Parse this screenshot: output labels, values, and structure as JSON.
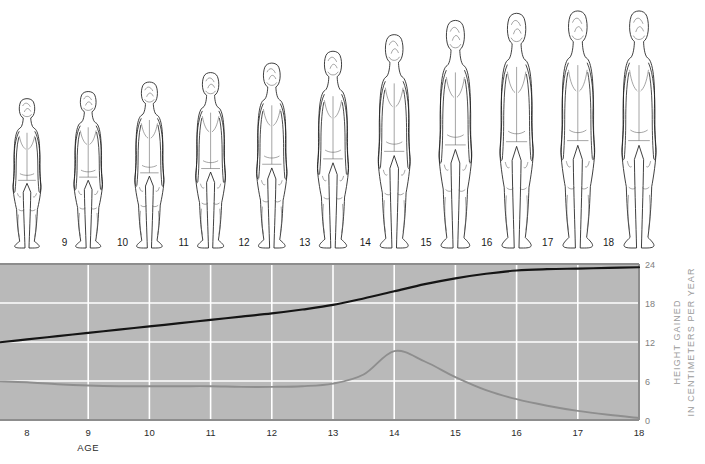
{
  "figures": {
    "caption_note": "Back-view line drawings of a growing human figure, one per age",
    "ages": [
      "8",
      "9",
      "10",
      "11",
      "12",
      "13",
      "14",
      "15",
      "16",
      "17",
      "18"
    ],
    "relative_heights": [
      0.63,
      0.66,
      0.7,
      0.74,
      0.78,
      0.83,
      0.9,
      0.96,
      0.99,
      1.0,
      1.0
    ],
    "line_color": "#1d1d1d",
    "fill_color": "#ffffff"
  },
  "chart_data": {
    "type": "line",
    "title": "",
    "subtitle": "",
    "xlabel": "AGE",
    "ylabel": "HEIGHT GAINED IN CENTIMETERS PER YEAR",
    "ylabel_line1": "HEIGHT GAINED",
    "ylabel_line2": "IN CENTIMETERS PER YEAR",
    "xlim": [
      8,
      18
    ],
    "ylim": [
      0,
      24
    ],
    "xticks": [
      "8",
      "9",
      "10",
      "11",
      "12",
      "13",
      "14",
      "15",
      "16",
      "17",
      "18"
    ],
    "yticks": [
      "0",
      "6",
      "12",
      "18",
      "24"
    ],
    "grid": true,
    "legend_position": "none",
    "plot_background": "#b9b9b9",
    "gridline_color": "#ffffff",
    "x": [
      8,
      8.5,
      9,
      9.5,
      10,
      10.5,
      11,
      11.5,
      12,
      12.5,
      13,
      13.5,
      14,
      14.5,
      15,
      15.5,
      16,
      16.5,
      17,
      17.5,
      18
    ],
    "series": [
      {
        "name": "Cumulative height gained",
        "color": "#151515",
        "values": [
          12.4,
          12.9,
          13.4,
          13.9,
          14.4,
          14.9,
          15.4,
          15.9,
          16.4,
          17.0,
          17.7,
          18.7,
          19.8,
          20.9,
          21.8,
          22.5,
          23.0,
          23.2,
          23.3,
          23.4,
          23.5
        ]
      },
      {
        "name": "Height gained per year (growth velocity)",
        "color": "#8e8e8e",
        "values": [
          5.8,
          5.5,
          5.3,
          5.2,
          5.2,
          5.2,
          5.2,
          5.1,
          5.1,
          5.2,
          5.6,
          7.0,
          10.6,
          9.0,
          6.6,
          4.6,
          3.2,
          2.2,
          1.4,
          0.8,
          0.3
        ]
      }
    ],
    "annotations": []
  }
}
